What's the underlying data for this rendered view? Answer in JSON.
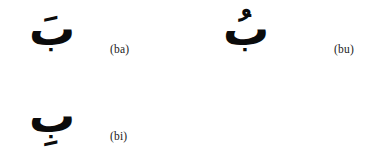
{
  "page": {
    "background_color": "#ffffff",
    "ink_color": "#0b0b0b",
    "label_color": "#1a1a1a"
  },
  "entries": [
    {
      "glyph": "بَ",
      "base_letter": "ب",
      "diacritic_name": "fatha",
      "diacritic_position": "above",
      "label": "(ba)",
      "transliteration": "ba",
      "row": 0,
      "column": 0
    },
    {
      "glyph": "بُ",
      "base_letter": "ب",
      "diacritic_name": "damma",
      "diacritic_position": "above",
      "label": "(bu)",
      "transliteration": "bu",
      "row": 0,
      "column": 1
    },
    {
      "glyph": "بِ",
      "base_letter": "ب",
      "diacritic_name": "kasra",
      "diacritic_position": "below",
      "label": "(bi)",
      "transliteration": "bi",
      "row": 1,
      "column": 0
    }
  ]
}
